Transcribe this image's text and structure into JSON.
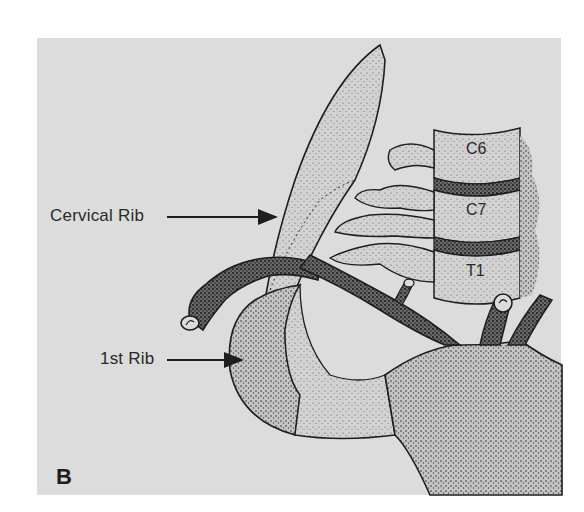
{
  "figure": {
    "panel_letter": "B",
    "background_color": "#dcdcdc",
    "ink_color": "#1e1e1e"
  },
  "callouts": [
    {
      "id": "cervical-rib",
      "label": "Cervical Rib"
    },
    {
      "id": "first-rib",
      "label": "1st Rib"
    }
  ],
  "vertebrae": [
    {
      "id": "c6",
      "label": "C6"
    },
    {
      "id": "c7",
      "label": "C7"
    },
    {
      "id": "t1",
      "label": "T1"
    }
  ]
}
